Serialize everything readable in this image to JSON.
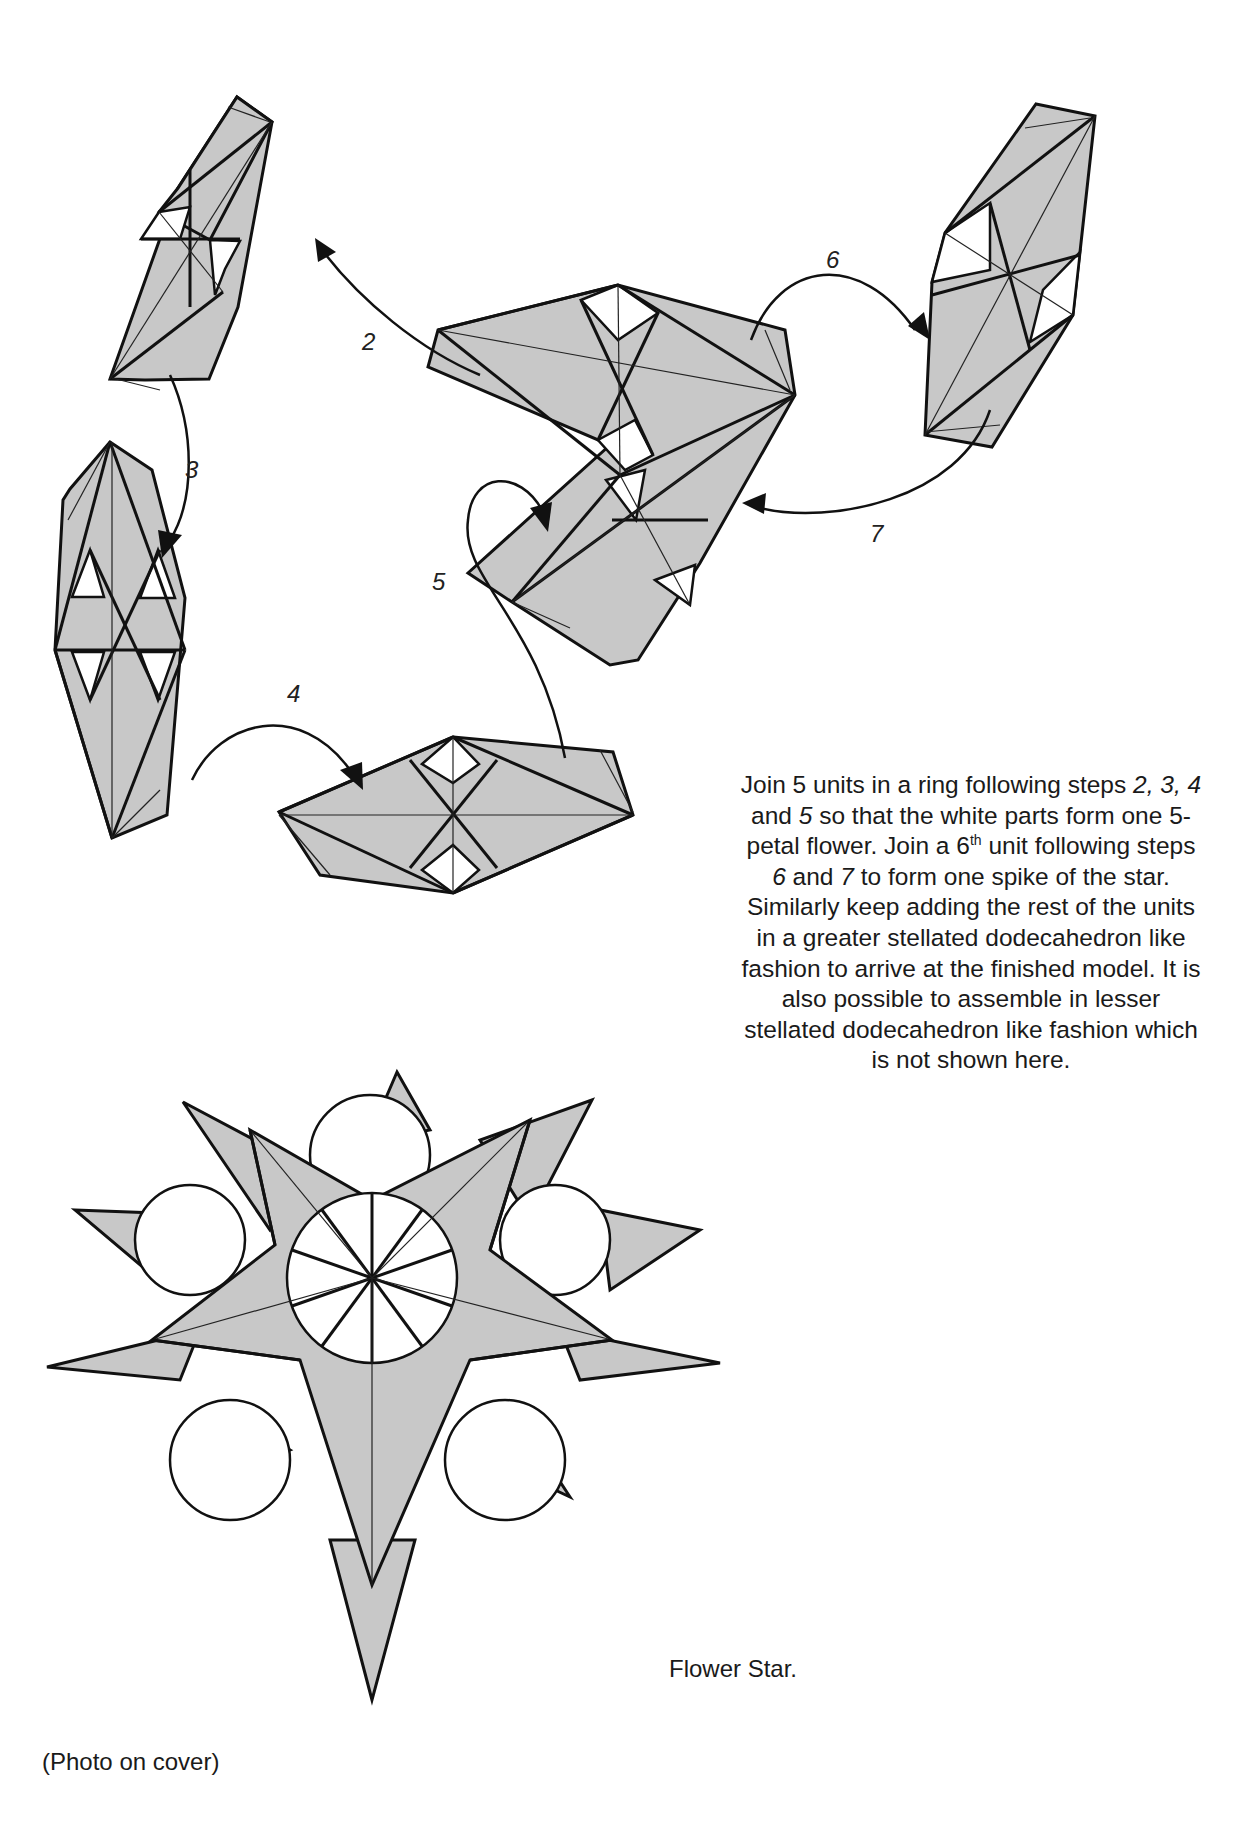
{
  "figure": {
    "type": "origami assembly diagram",
    "unit_fill": "#c8c8c8",
    "line_color": "#111111",
    "paper_white": "#ffffff"
  },
  "steps": [
    {
      "id": "2",
      "label": "2",
      "desc": "arrow from center unit to upper-left unit"
    },
    {
      "id": "3",
      "label": "3",
      "desc": "arrow from upper-left unit down to left unit"
    },
    {
      "id": "4",
      "label": "4",
      "desc": "arrow from left unit to bottom unit"
    },
    {
      "id": "5",
      "label": "5",
      "desc": "arrow from bottom unit to center unit"
    },
    {
      "id": "6",
      "label": "6",
      "desc": "arrow from center unit to right unit"
    },
    {
      "id": "7",
      "label": "7",
      "desc": "arrow from right unit back to center unit"
    }
  ],
  "instructions": {
    "line1_pre": "Join 5 units in a ring following steps ",
    "step_a": "2, 3, 4",
    "line1_mid": " and ",
    "step_b": "5",
    "line1_post": " so that the white parts form one 5-petal flower.  Join a 6",
    "ordinal_suffix": "th",
    "line2_pre": " unit following steps ",
    "step_c": "6",
    "line2_mid": " and ",
    "step_d": "7",
    "line2_post": " to form one spike of the star. Similarly keep adding the rest of the units in a greater stellated dodecahedron like fashion to arrive at the finished model.  It is also possible to assemble in lesser stellated dodecahedron like fashion which is not shown here."
  },
  "captions": {
    "model_name": "Flower Star.",
    "photo_note": "(Photo on cover)"
  }
}
